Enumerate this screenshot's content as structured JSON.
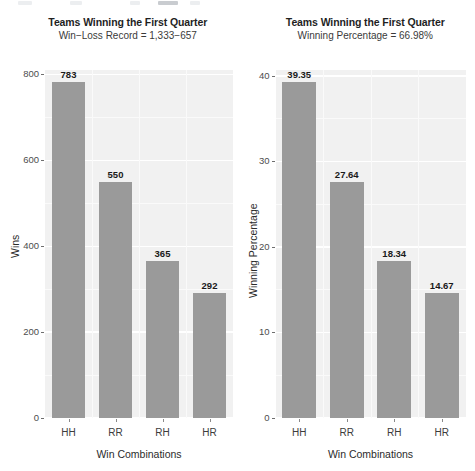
{
  "figure": {
    "background_color": "#ffffff",
    "panel_color": "#f1f1f1",
    "grid_color": "#ffffff",
    "bar_color": "#9a9a9a",
    "text_color": "#3c3c3c"
  },
  "chart_data": [
    {
      "type": "bar",
      "title": "Teams Winning the First Quarter",
      "subtitle": "Win−Loss Record = 1,333−657",
      "xlabel": "Win Combinations",
      "ylabel": "Wins",
      "categories": [
        "HH",
        "RR",
        "RH",
        "HR"
      ],
      "values": [
        783,
        550,
        365,
        292
      ],
      "value_labels": [
        "783",
        "550",
        "365",
        "292"
      ],
      "ylim": [
        0,
        810
      ],
      "yticks": [
        0,
        200,
        400,
        600,
        800
      ],
      "ytick_labels": [
        "0",
        "200",
        "400",
        "600",
        "800"
      ],
      "grid": true,
      "legend": "none"
    },
    {
      "type": "bar",
      "title": "Teams Winning the First Quarter",
      "subtitle": "Winning Percentage = 66.98%",
      "xlabel": "Win Combinations",
      "ylabel": "Winning Percentage",
      "categories": [
        "HH",
        "RR",
        "RH",
        "HR"
      ],
      "values": [
        39.35,
        27.64,
        18.34,
        14.67
      ],
      "value_labels": [
        "39.35",
        "27.64",
        "18.34",
        "14.67"
      ],
      "ylim": [
        0,
        40.7
      ],
      "yticks": [
        0,
        10,
        20,
        30,
        40
      ],
      "ytick_labels": [
        "0",
        "10",
        "20",
        "30",
        "40"
      ],
      "grid": true,
      "legend": "none"
    }
  ]
}
